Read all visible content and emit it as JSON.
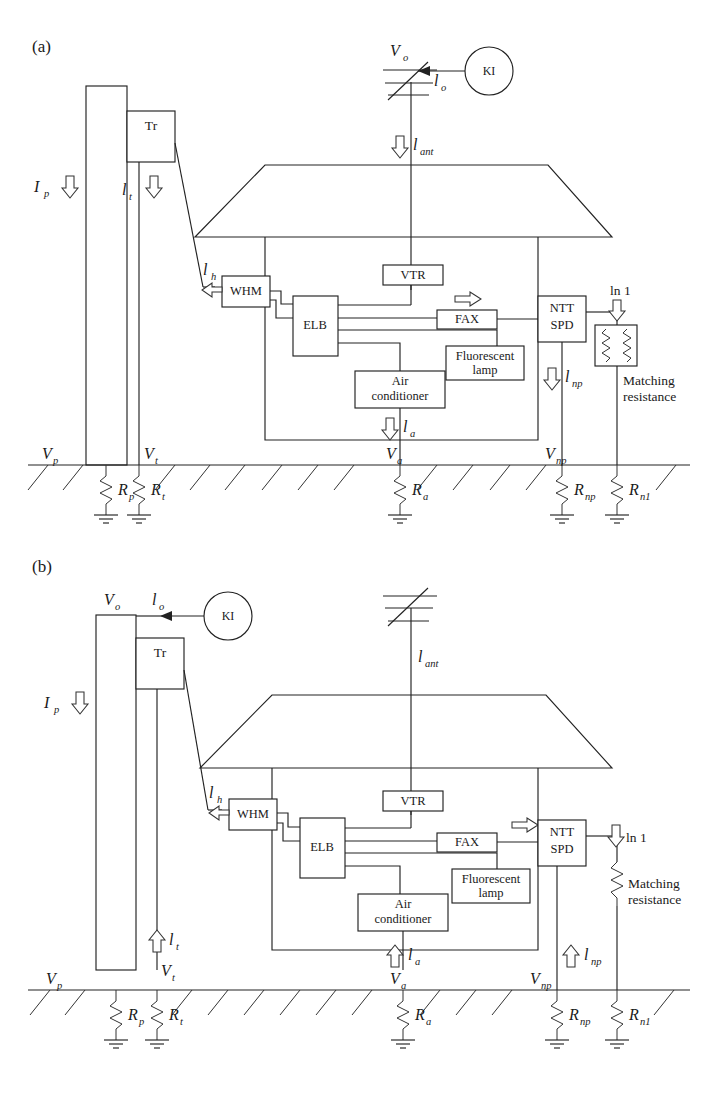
{
  "figure": {
    "panels": [
      {
        "id": "a",
        "label": "(a)",
        "current_direction": "down",
        "blocks": [
          {
            "name": "transformer",
            "label": "Tr"
          },
          {
            "name": "watt-hour-meter",
            "label": "WHM"
          },
          {
            "name": "earth-leakage-breaker",
            "label": "ELB"
          },
          {
            "name": "vtr",
            "label": "VTR"
          },
          {
            "name": "fax",
            "label": "FAX"
          },
          {
            "name": "fluorescent-lamp",
            "label": "Fluorescent lamp"
          },
          {
            "name": "air-conditioner",
            "label": "Air conditioner"
          },
          {
            "name": "ntt-spd",
            "label": "NTT SPD"
          },
          {
            "name": "current-injector",
            "label": "KI"
          }
        ],
        "currents": [
          {
            "name": "pole-current",
            "label": "I",
            "sub": "p"
          },
          {
            "name": "transformer-current",
            "label": "l",
            "sub": "t"
          },
          {
            "name": "injected-current",
            "label": "l",
            "sub": "o"
          },
          {
            "name": "antenna-current",
            "label": "l",
            "sub": "ant"
          },
          {
            "name": "service-drop-current",
            "label": "l",
            "sub": "h"
          },
          {
            "name": "air-conditioner-current",
            "label": "l",
            "sub": "a"
          },
          {
            "name": "ntt-line-current",
            "label": "l",
            "sub": "np"
          },
          {
            "name": "line-1-current",
            "label": "ln 1",
            "sub": ""
          }
        ],
        "voltages": [
          {
            "name": "injection-voltage",
            "label": "V",
            "sub": "o"
          },
          {
            "name": "pole-voltage",
            "label": "V",
            "sub": "p"
          },
          {
            "name": "transformer-voltage",
            "label": "V",
            "sub": "t"
          },
          {
            "name": "air-conditioner-voltage",
            "label": "V",
            "sub": "a"
          },
          {
            "name": "ntt-voltage",
            "label": "V",
            "sub": "np"
          }
        ],
        "resistances": [
          {
            "name": "pole-ground-resistance",
            "label": "R",
            "sub": "p"
          },
          {
            "name": "transformer-ground-resistance",
            "label": "R",
            "sub": "t"
          },
          {
            "name": "air-conditioner-ground-resistance",
            "label": "R",
            "sub": "a"
          },
          {
            "name": "ntt-ground-resistance",
            "label": "R",
            "sub": "np"
          },
          {
            "name": "line1-ground-resistance",
            "label": "R",
            "sub": "n1"
          }
        ],
        "matching_resistance_label": "Matching resistance",
        "matching_resistance_style": "boxed-dual-resistor"
      },
      {
        "id": "b",
        "label": "(b)",
        "current_direction": "up",
        "blocks": [
          {
            "name": "transformer",
            "label": "Tr"
          },
          {
            "name": "watt-hour-meter",
            "label": "WHM"
          },
          {
            "name": "earth-leakage-breaker",
            "label": "ELB"
          },
          {
            "name": "vtr",
            "label": "VTR"
          },
          {
            "name": "fax",
            "label": "FAX"
          },
          {
            "name": "fluorescent-lamp",
            "label": "Fluorescent lamp"
          },
          {
            "name": "air-conditioner",
            "label": "Air conditioner"
          },
          {
            "name": "ntt-spd",
            "label": "NTT SPD"
          },
          {
            "name": "current-injector",
            "label": "KI"
          }
        ],
        "currents": [
          {
            "name": "pole-current",
            "label": "I",
            "sub": "p"
          },
          {
            "name": "transformer-current",
            "label": "l",
            "sub": "t"
          },
          {
            "name": "injected-current",
            "label": "l",
            "sub": "o"
          },
          {
            "name": "antenna-current",
            "label": "l",
            "sub": "ant"
          },
          {
            "name": "service-drop-current",
            "label": "l",
            "sub": "h"
          },
          {
            "name": "air-conditioner-current",
            "label": "l",
            "sub": "a"
          },
          {
            "name": "ntt-line-current",
            "label": "l",
            "sub": "np"
          },
          {
            "name": "line-1-current",
            "label": "ln 1",
            "sub": ""
          }
        ],
        "voltages": [
          {
            "name": "injection-voltage",
            "label": "V",
            "sub": "o"
          },
          {
            "name": "pole-voltage",
            "label": "V",
            "sub": "p"
          },
          {
            "name": "transformer-voltage",
            "label": "V",
            "sub": "t"
          },
          {
            "name": "air-conditioner-voltage",
            "label": "V",
            "sub": "a"
          },
          {
            "name": "ntt-voltage",
            "label": "V",
            "sub": "np"
          }
        ],
        "resistances": [
          {
            "name": "pole-ground-resistance",
            "label": "R",
            "sub": "p"
          },
          {
            "name": "transformer-ground-resistance",
            "label": "R",
            "sub": "t"
          },
          {
            "name": "air-conditioner-ground-resistance",
            "label": "R",
            "sub": "a"
          },
          {
            "name": "ntt-ground-resistance",
            "label": "R",
            "sub": "np"
          },
          {
            "name": "line1-ground-resistance",
            "label": "R",
            "sub": "n1"
          }
        ],
        "matching_resistance_label": "Matching resistance",
        "matching_resistance_style": "plain-resistor"
      }
    ],
    "caption_fragment": ""
  },
  "colors": {
    "stroke": "#222222",
    "background": "#ffffff",
    "text": "#1a1a1a"
  }
}
